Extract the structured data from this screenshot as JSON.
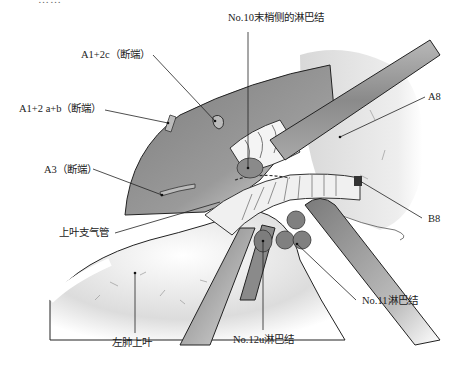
{
  "figure": {
    "title_cut_off": "……",
    "colors": {
      "lung_dark": "#8e8e8e",
      "lung_light": "#f1f1f1",
      "instrument": "#9a9a9a",
      "lymph_node": "#7d7d7d",
      "line": "#222222",
      "background": "#ffffff"
    },
    "labels": {
      "a12c": "A1+2c（断端）",
      "no10": "No.10末梢侧的淋巴结",
      "a12ab": "A1+2 a+b（断端）",
      "a8": "A8",
      "a3": "A3（断端）",
      "b8": "B8",
      "upper_bronchus": "上叶支气管",
      "no11": "No.11淋巴结",
      "left_upper_lobe": "左肺上叶",
      "no12u": "No.12u淋巴结"
    }
  }
}
